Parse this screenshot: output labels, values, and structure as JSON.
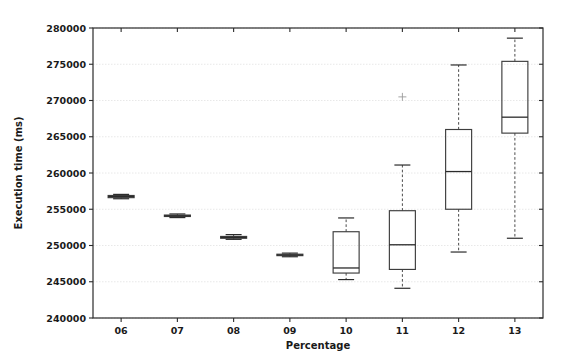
{
  "chart_data": {
    "type": "box",
    "title": "",
    "xlabel": "Percentage",
    "ylabel": "Execution time (ms)",
    "categories": [
      "06",
      "07",
      "08",
      "09",
      "10",
      "11",
      "12",
      "13"
    ],
    "xtick_labels": [
      "06",
      "07",
      "08",
      "09",
      "10",
      "11",
      "12",
      "13"
    ],
    "ytick_labels": [
      "240000",
      "245000",
      "250000",
      "255000",
      "260000",
      "265000",
      "270000",
      "275000",
      "280000"
    ],
    "ytick_values": [
      240000,
      245000,
      250000,
      255000,
      260000,
      265000,
      270000,
      275000,
      280000
    ],
    "ylim": [
      240000,
      280000
    ],
    "xlim": [
      0.5,
      8.5
    ],
    "grid": true,
    "grid_axis": "y",
    "legend": "none",
    "colors": {
      "box_edge": "#3d3d3d",
      "median": "#2b2b2b",
      "whisker": "#4a4a4a",
      "cap": "#2b2b2b",
      "flier": "#9a9a9a",
      "grid": "#e2e2e2",
      "spine": "#2b2b2b",
      "background": "#ffffff",
      "text": "#1a1a1a"
    },
    "boxes": [
      {
        "category": "06",
        "whisker_low": 256450,
        "q1": 256600,
        "median": 256750,
        "q3": 256900,
        "whisker_high": 257050,
        "fliers": []
      },
      {
        "category": "07",
        "whisker_low": 253850,
        "q1": 254000,
        "median": 254100,
        "q3": 254200,
        "whisker_high": 254350,
        "fliers": []
      },
      {
        "category": "08",
        "whisker_low": 250850,
        "q1": 251000,
        "median": 251100,
        "q3": 251250,
        "whisker_high": 251500,
        "fliers": []
      },
      {
        "category": "09",
        "whisker_low": 248450,
        "q1": 248600,
        "median": 248700,
        "q3": 248800,
        "whisker_high": 248950,
        "fliers": []
      },
      {
        "category": "10",
        "whisker_low": 245300,
        "q1": 246200,
        "median": 246900,
        "q3": 251900,
        "whisker_high": 253800,
        "fliers": []
      },
      {
        "category": "11",
        "whisker_low": 244100,
        "q1": 246700,
        "median": 250100,
        "q3": 254800,
        "whisker_high": 261100,
        "fliers": [
          270500
        ]
      },
      {
        "category": "12",
        "whisker_low": 249100,
        "q1": 255000,
        "median": 260200,
        "q3": 266000,
        "whisker_high": 274900,
        "fliers": []
      },
      {
        "category": "13",
        "whisker_low": 251000,
        "q1": 265500,
        "median": 267700,
        "q3": 275400,
        "whisker_high": 278600,
        "fliers": []
      }
    ]
  }
}
